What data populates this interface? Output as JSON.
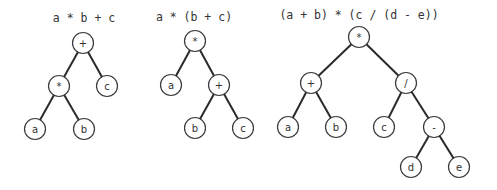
{
  "trees": [
    {
      "expression": "a * b + c",
      "caption_pos": [
        84,
        22
      ],
      "nodes": [
        {
          "id": "n0",
          "label": "+",
          "x": 83,
          "y": 43
        },
        {
          "id": "n1",
          "label": "*",
          "x": 59,
          "y": 86
        },
        {
          "id": "n2",
          "label": "c",
          "x": 107,
          "y": 86
        },
        {
          "id": "n3",
          "label": "a",
          "x": 35,
          "y": 129
        },
        {
          "id": "n4",
          "label": "b",
          "x": 84,
          "y": 129
        }
      ],
      "edges": [
        [
          "n0",
          "n1"
        ],
        [
          "n0",
          "n2"
        ],
        [
          "n1",
          "n3"
        ],
        [
          "n1",
          "n4"
        ]
      ]
    },
    {
      "expression": "a * (b + c)",
      "caption_pos": [
        194,
        21
      ],
      "nodes": [
        {
          "id": "n0",
          "label": "*",
          "x": 195,
          "y": 41
        },
        {
          "id": "n1",
          "label": "a",
          "x": 171,
          "y": 85
        },
        {
          "id": "n2",
          "label": "+",
          "x": 219,
          "y": 85
        },
        {
          "id": "n3",
          "label": "b",
          "x": 195,
          "y": 128
        },
        {
          "id": "n4",
          "label": "c",
          "x": 243,
          "y": 128
        }
      ],
      "edges": [
        [
          "n0",
          "n1"
        ],
        [
          "n0",
          "n2"
        ],
        [
          "n2",
          "n3"
        ],
        [
          "n2",
          "n4"
        ]
      ]
    },
    {
      "expression": "(a + b) * (c / (d - e))",
      "caption_pos": [
        359,
        19
      ],
      "nodes": [
        {
          "id": "n0",
          "label": "*",
          "x": 359,
          "y": 37
        },
        {
          "id": "n1",
          "label": "+",
          "x": 311,
          "y": 83
        },
        {
          "id": "n2",
          "label": "/",
          "x": 406,
          "y": 83
        },
        {
          "id": "n3",
          "label": "a",
          "x": 288,
          "y": 127
        },
        {
          "id": "n4",
          "label": "b",
          "x": 336,
          "y": 127
        },
        {
          "id": "n5",
          "label": "c",
          "x": 384,
          "y": 127
        },
        {
          "id": "n6",
          "label": "-",
          "x": 434,
          "y": 127
        },
        {
          "id": "n7",
          "label": "d",
          "x": 411,
          "y": 167
        },
        {
          "id": "n8",
          "label": "e",
          "x": 459,
          "y": 167
        }
      ],
      "edges": [
        [
          "n0",
          "n1"
        ],
        [
          "n0",
          "n2"
        ],
        [
          "n1",
          "n3"
        ],
        [
          "n1",
          "n4"
        ],
        [
          "n2",
          "n5"
        ],
        [
          "n2",
          "n6"
        ],
        [
          "n6",
          "n7"
        ],
        [
          "n6",
          "n8"
        ]
      ]
    }
  ],
  "style": {
    "node_radius": 10.5,
    "edge_color": "#2a2a2a",
    "node_stroke": "#3a3a3a",
    "text_color": "#333333",
    "background": "#ffffff"
  }
}
